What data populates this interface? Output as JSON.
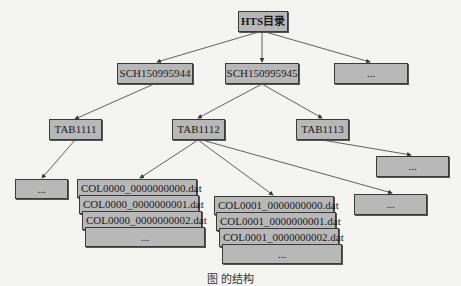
{
  "diagram": {
    "type": "tree",
    "root": {
      "id": "root",
      "label": "HTS目录"
    },
    "schemas": [
      {
        "id": "sch1",
        "label": "SCH150995944"
      },
      {
        "id": "sch2",
        "label": "SCH150995945"
      },
      {
        "id": "sch3",
        "label": "..."
      }
    ],
    "tables": [
      {
        "id": "tab1",
        "label": "TAB1111",
        "parent": "sch1"
      },
      {
        "id": "tab2",
        "label": "TAB1112",
        "parent": "sch2"
      },
      {
        "id": "tab3",
        "label": "TAB1113",
        "parent": "sch2"
      }
    ],
    "leaves": {
      "tab1_more": {
        "label": "...",
        "parent": "tab1"
      },
      "tab3_more": {
        "label": "...",
        "parent": "tab3"
      },
      "tab2_more": {
        "label": "...",
        "parent": "tab2"
      }
    },
    "col0000_files": [
      "COL0000_0000000000.dat",
      "COL0000_0000000001.dat",
      "COL0000_0000000002.dat",
      "..."
    ],
    "col0001_files": [
      "COL0001_0000000000.dat",
      "COL0001_0000000001.dat",
      "COL0001_0000000002.dat",
      "..."
    ],
    "colors": {
      "node_fill": "#b8b8b8",
      "node_border": "#3a3a3a",
      "edge": "#3a3a3a",
      "background": "#f4f4f2"
    }
  },
  "caption": "图      的结构"
}
